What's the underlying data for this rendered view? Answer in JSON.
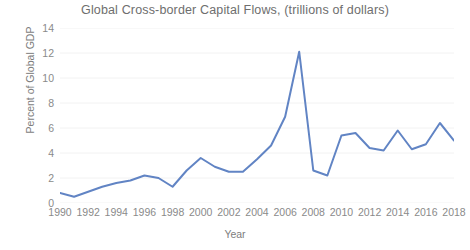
{
  "chart_data": {
    "type": "line",
    "title": "Global Cross-border Capital Flows, (trillions of dollars)",
    "xlabel": "Year",
    "ylabel": "Percent of Global GDP",
    "grid": true,
    "legend": "none",
    "line_color": "#6184c4",
    "text_color": "#7d7d7d",
    "grid_color": "#f2f2f2",
    "xlim": [
      1990,
      2018
    ],
    "ylim": [
      0,
      14
    ],
    "ytick_step": 2,
    "xtick_step": 2,
    "yticks": [
      "14",
      "12",
      "10",
      "8",
      "6",
      "4",
      "2",
      "0"
    ],
    "xticks": [
      "1990",
      "1992",
      "1994",
      "1996",
      "1998",
      "2000",
      "2002",
      "2004",
      "2006",
      "2008",
      "2010",
      "2012",
      "2014",
      "2016",
      "2018"
    ],
    "x": [
      1990,
      1991,
      1992,
      1993,
      1994,
      1995,
      1996,
      1997,
      1998,
      1999,
      2000,
      2001,
      2002,
      2003,
      2004,
      2005,
      2006,
      2007,
      2008,
      2009,
      2010,
      2011,
      2012,
      2013,
      2014,
      2015,
      2016,
      2017,
      2018
    ],
    "values": [
      0.8,
      0.5,
      0.9,
      1.3,
      1.6,
      1.8,
      2.2,
      2.0,
      1.3,
      2.6,
      3.6,
      2.9,
      2.5,
      2.5,
      3.5,
      4.6,
      6.9,
      12.1,
      2.6,
      2.2,
      5.4,
      5.6,
      4.4,
      4.2,
      5.8,
      4.3,
      4.7,
      6.4,
      5.0
    ],
    "series_name": "Global cross-border capital flows"
  }
}
